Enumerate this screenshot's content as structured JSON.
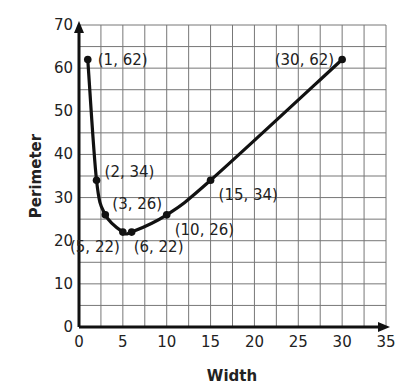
{
  "chart_data": {
    "type": "line",
    "title": "",
    "xlabel": "Width",
    "ylabel": "Perimeter",
    "xlim": [
      0,
      35
    ],
    "ylim": [
      0,
      70
    ],
    "xticks": [
      0,
      5,
      10,
      15,
      20,
      25,
      30,
      35
    ],
    "yticks": [
      0,
      10,
      20,
      30,
      40,
      50,
      60,
      70
    ],
    "grid": true,
    "grid_step": {
      "x": 2.5,
      "y": 5
    },
    "legend": null,
    "series": [
      {
        "name": "Perimeter vs Width",
        "x": [
          1,
          2,
          3,
          5,
          6,
          10,
          15,
          30
        ],
        "y": [
          62,
          34,
          26,
          22,
          22,
          26,
          34,
          62
        ]
      }
    ],
    "annotations": [
      {
        "text": "(1, 62)",
        "x": 1,
        "y": 62
      },
      {
        "text": "(2, 34)",
        "x": 2,
        "y": 34
      },
      {
        "text": "(3, 26)",
        "x": 3,
        "y": 26
      },
      {
        "text": "(5, 22)",
        "x": 5,
        "y": 22
      },
      {
        "text": "(6, 22)",
        "x": 6,
        "y": 22
      },
      {
        "text": "(10, 26)",
        "x": 10,
        "y": 26
      },
      {
        "text": "(15, 34)",
        "x": 15,
        "y": 34
      },
      {
        "text": "(30, 62)",
        "x": 30,
        "y": 62
      }
    ],
    "colors": {
      "line": "#111111",
      "grid": "#777777",
      "axis": "#111111"
    }
  }
}
